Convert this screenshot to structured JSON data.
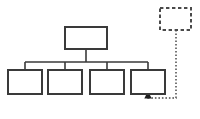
{
  "diagram": {
    "background_color": "#ffffff",
    "stroke_color": "#3a3a3a",
    "solid_stroke_width": 2,
    "dashed_stroke_width": 2,
    "dotted_stroke_width": 1.4,
    "canvas": {
      "width": 200,
      "height": 119
    },
    "nodes": [
      {
        "id": "root",
        "name": "root-node",
        "label": "",
        "style": "solid",
        "x": 65,
        "y": 27,
        "width": 42,
        "height": 22
      },
      {
        "id": "child-1",
        "name": "child-node-1",
        "label": "",
        "style": "solid",
        "x": 8,
        "y": 70,
        "width": 34,
        "height": 24
      },
      {
        "id": "child-2",
        "name": "child-node-2",
        "label": "",
        "style": "solid",
        "x": 48,
        "y": 70,
        "width": 34,
        "height": 24
      },
      {
        "id": "child-3",
        "name": "child-node-3",
        "label": "",
        "style": "solid",
        "x": 90,
        "y": 70,
        "width": 34,
        "height": 24
      },
      {
        "id": "child-4",
        "name": "child-node-4",
        "label": "",
        "style": "solid",
        "x": 131,
        "y": 70,
        "width": 34,
        "height": 24
      },
      {
        "id": "external",
        "name": "external-dashed-node",
        "label": "",
        "style": "dashed",
        "x": 160,
        "y": 8,
        "width": 31,
        "height": 22
      }
    ],
    "connectors": [
      {
        "id": "root-drop",
        "name": "connector-root-to-bus",
        "style": "solid",
        "points": "86,49 86,62"
      },
      {
        "id": "bus",
        "name": "connector-horizontal-bus",
        "style": "solid",
        "points": "25,62 148,62"
      },
      {
        "id": "bus-to-child-1",
        "name": "connector-bus-to-child-1",
        "style": "solid",
        "points": "25,62 25,70"
      },
      {
        "id": "bus-to-child-2",
        "name": "connector-bus-to-child-2",
        "style": "solid",
        "points": "65,62 65,70"
      },
      {
        "id": "bus-to-child-3",
        "name": "connector-bus-to-child-3",
        "style": "solid",
        "points": "107,62 107,70"
      },
      {
        "id": "bus-to-child-4",
        "name": "connector-bus-to-child-4",
        "style": "solid",
        "points": "148,62 148,70"
      },
      {
        "id": "feedback",
        "name": "connector-feedback-dotted",
        "style": "dotted",
        "points": "176,30 176,98 148,98 148,95"
      }
    ],
    "arrowheads": [
      {
        "id": "feedback-arrow",
        "name": "arrowhead-into-child-4",
        "points": "148,93 144.2,99.5 151.8,99.5",
        "direction": "up"
      }
    ]
  }
}
